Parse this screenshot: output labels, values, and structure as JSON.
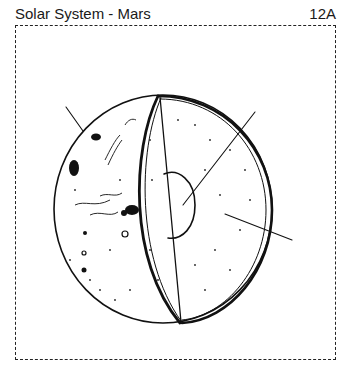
{
  "header": {
    "title": "Solar System - Mars",
    "page_id": "12A"
  },
  "diagram": {
    "parts": [
      {
        "name": "surface",
        "label_line": "upper-left pointer"
      },
      {
        "name": "core",
        "label_line": "center pointer"
      },
      {
        "name": "mantle",
        "label_line": "right pointer"
      }
    ],
    "labels_text": [
      "",
      "",
      ""
    ],
    "colors": {
      "ink": "#111111",
      "paper": "#ffffff"
    }
  }
}
